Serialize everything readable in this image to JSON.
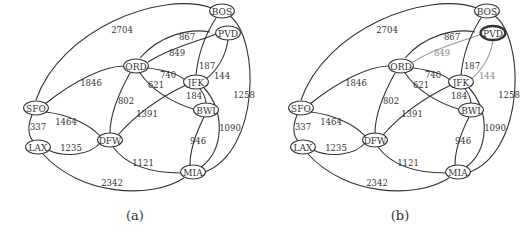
{
  "figure": {
    "panels": [
      {
        "id": "a",
        "caption": "(a)",
        "offset_x": 0,
        "highlighted_nodes": [],
        "dimmed_edges": []
      },
      {
        "id": "b",
        "caption": "(b)",
        "offset_x": 265,
        "highlighted_nodes": [
          "PVD"
        ],
        "dimmed_edges": [
          "ORD-PVD",
          "PVD-JFK"
        ]
      }
    ],
    "colors": {
      "line": "#333333",
      "dimmed": "#9a9a9a",
      "background": "#ffffff"
    },
    "nodes": [
      {
        "id": "BOS",
        "label": "BOS",
        "x": 222,
        "y": 11
      },
      {
        "id": "PVD",
        "label": "PVD",
        "x": 228,
        "y": 33
      },
      {
        "id": "ORD",
        "label": "ORD",
        "x": 136,
        "y": 66
      },
      {
        "id": "JFK",
        "label": "JFK",
        "x": 196,
        "y": 82
      },
      {
        "id": "BWI",
        "label": "BWI",
        "x": 206,
        "y": 110
      },
      {
        "id": "SFO",
        "label": "SFO",
        "x": 36,
        "y": 108
      },
      {
        "id": "LAX",
        "label": "LAX",
        "x": 38,
        "y": 147
      },
      {
        "id": "DFW",
        "label": "DFW",
        "x": 110,
        "y": 140
      },
      {
        "id": "MIA",
        "label": "MIA",
        "x": 193,
        "y": 172
      }
    ],
    "edges": [
      {
        "id": "SFO-BOS",
        "from": "SFO",
        "to": "BOS",
        "weight": "2704",
        "path": "M36,100 C60,30 160,-10 212,8",
        "lx": 122,
        "ly": 30
      },
      {
        "id": "ORD-BOS",
        "from": "ORD",
        "to": "BOS",
        "weight": "867",
        "path": "M140,58 C160,35 190,28 210,32",
        "lx": 187,
        "ly": 37
      },
      {
        "id": "ORD-PVD",
        "from": "ORD",
        "to": "PVD",
        "weight": "849",
        "path": "M148,62 C175,45 205,40 218,33",
        "lx": 177,
        "ly": 53
      },
      {
        "id": "BOS-JFK",
        "from": "BOS",
        "to": "JFK",
        "weight": "187",
        "path": "M216,18 C205,35 198,55 196,75",
        "lx": 207,
        "ly": 66
      },
      {
        "id": "PVD-JFK",
        "from": "PVD",
        "to": "JFK",
        "weight": "144",
        "path": "M228,40 C225,60 215,72 205,80",
        "lx": 222,
        "ly": 76
      },
      {
        "id": "ORD-JFK",
        "from": "ORD",
        "to": "JFK",
        "weight": "740",
        "path": "M148,68 C165,70 178,74 185,80",
        "lx": 168,
        "ly": 75
      },
      {
        "id": "ORD-BWI",
        "from": "ORD",
        "to": "BWI",
        "weight": "621",
        "path": "M140,73 C155,95 180,105 196,110",
        "lx": 156,
        "ly": 85
      },
      {
        "id": "JFK-BWI",
        "from": "JFK",
        "to": "BWI",
        "weight": "184",
        "path": "M200,89 C205,95 206,100 206,104",
        "lx": 194,
        "ly": 96
      },
      {
        "id": "SFO-ORD",
        "from": "SFO",
        "to": "ORD",
        "weight": "1846",
        "path": "M45,104 C75,80 105,66 124,66",
        "lx": 91,
        "ly": 83
      },
      {
        "id": "ORD-DFW",
        "from": "ORD",
        "to": "DFW",
        "weight": "802",
        "path": "M130,73 C115,100 110,120 110,133",
        "lx": 126,
        "ly": 101
      },
      {
        "id": "DFW-JFK",
        "from": "DFW",
        "to": "JFK",
        "weight": "1391",
        "path": "M118,135 C140,110 165,95 186,85",
        "lx": 147,
        "ly": 114
      },
      {
        "id": "BOS-MIA",
        "from": "BOS",
        "to": "MIA",
        "weight": "1258",
        "path": "M230,16 C260,40 260,150 205,172",
        "lx": 244,
        "ly": 95
      },
      {
        "id": "JFK-MIA",
        "from": "JFK",
        "to": "MIA",
        "weight": "1090",
        "path": "M204,88 C225,110 225,150 200,168",
        "lx": 230,
        "ly": 128
      },
      {
        "id": "BWI-MIA",
        "from": "BWI",
        "to": "MIA",
        "weight": "946",
        "path": "M204,117 C195,135 190,150 190,165",
        "lx": 198,
        "ly": 141
      },
      {
        "id": "SFO-LAX",
        "from": "SFO",
        "to": "LAX",
        "weight": "337",
        "path": "M32,115 C28,125 28,135 33,141",
        "lx": 38,
        "ly": 127
      },
      {
        "id": "SFO-DFW",
        "from": "SFO",
        "to": "DFW",
        "weight": "1464",
        "path": "M46,112 C70,115 90,125 100,136",
        "lx": 66,
        "ly": 122
      },
      {
        "id": "LAX-DFW",
        "from": "LAX",
        "to": "DFW",
        "weight": "1235",
        "path": "M48,150 C65,158 90,155 100,143",
        "lx": 71,
        "ly": 148
      },
      {
        "id": "DFW-MIA",
        "from": "DFW",
        "to": "MIA",
        "weight": "1121",
        "path": "M113,147 C130,170 160,173 181,173",
        "lx": 143,
        "ly": 163
      },
      {
        "id": "LAX-MIA",
        "from": "LAX",
        "to": "MIA",
        "weight": "2342",
        "path": "M43,154 C80,195 150,200 184,178",
        "lx": 112,
        "ly": 183
      }
    ]
  }
}
